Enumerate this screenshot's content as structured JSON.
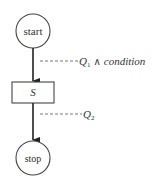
{
  "diagram": {
    "type": "flowchart",
    "nodes": {
      "start": {
        "label": "start",
        "shape": "circle"
      },
      "statement": {
        "label": "S",
        "shape": "rectangle"
      },
      "stop": {
        "label": "stop",
        "shape": "circle"
      }
    },
    "edges": [
      {
        "from": "start",
        "to": "statement"
      },
      {
        "from": "statement",
        "to": "stop"
      }
    ],
    "annotations": {
      "edge1": {
        "symbol": "Q",
        "subscript": "1",
        "operator": "∧",
        "text": "condition"
      },
      "edge2": {
        "symbol": "Q",
        "subscript": "2"
      }
    },
    "colors": {
      "stroke": "#333333",
      "dashed": "#555555",
      "background": "#ffffff"
    }
  }
}
